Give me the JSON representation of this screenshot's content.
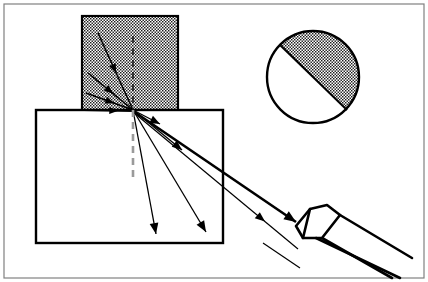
{
  "figure": {
    "width": 428,
    "height": 282,
    "background": "#ffffff"
  },
  "frame": {
    "x": 4,
    "y": 4,
    "width": 420,
    "height": 274,
    "stroke": "#808080",
    "stroke_width": 1.2
  },
  "colors": {
    "ink": "#000000",
    "stipple_dot": "#1a1a1a",
    "stipple_background": "#ffffff",
    "normal_upper": "#1a1a1a",
    "normal_lower": "#9a9a9a",
    "frame": "#808080"
  },
  "upper_medium": {
    "label": "upper-stippled-block",
    "x": 82,
    "y": 16,
    "width": 96,
    "height": 94,
    "stroke": "#000000",
    "stroke_width": 2.2,
    "fill": "stipple"
  },
  "substrate": {
    "label": "lower-substrate-block",
    "x": 36,
    "y": 110,
    "width": 187,
    "height": 133,
    "stroke": "#000000",
    "stroke_width": 2.4,
    "fill": "#ffffff"
  },
  "interface_point": {
    "label": "scattering-point",
    "x": 133,
    "y": 110
  },
  "normal_line": {
    "label": "surface-normal-dashed",
    "x": 133,
    "upper_y1": 36,
    "upper_y2": 110,
    "lower_y1": 110,
    "lower_y2": 180,
    "dash": "7,5",
    "stroke_width_upper": 1.6,
    "stroke_width_lower": 2.6
  },
  "incident_rays": [
    {
      "name": "incident-ray-1",
      "x1": 98,
      "y1": 33,
      "x2": 133,
      "y2": 110,
      "stroke_width": 1.5,
      "arrow_at": 0.52,
      "arrow_size": 9
    },
    {
      "name": "incident-ray-2",
      "x1": 88,
      "y1": 73,
      "x2": 133,
      "y2": 110,
      "stroke_width": 1.6,
      "arrow_at": 0.56,
      "arrow_size": 9
    },
    {
      "name": "incident-ray-3",
      "x1": 86,
      "y1": 93,
      "x2": 133,
      "y2": 110,
      "stroke_width": 1.6,
      "arrow_at": 0.6,
      "arrow_size": 9
    },
    {
      "name": "incident-ray-4",
      "x1": 84,
      "y1": 110,
      "x2": 133,
      "y2": 111,
      "stroke_width": 1.8,
      "arrow_at": 0.7,
      "arrow_size": 9
    }
  ],
  "scattered_rays": [
    {
      "name": "scattered-ray-steep",
      "x1": 133,
      "y1": 110,
      "x2": 156,
      "y2": 234,
      "stroke_width": 1.3,
      "arrow_at": 1.0,
      "arrow_size": 11
    },
    {
      "name": "scattered-ray-mid",
      "x1": 133,
      "y1": 110,
      "x2": 206,
      "y2": 232,
      "stroke_width": 1.3,
      "arrow_at": 1.0,
      "arrow_size": 11
    },
    {
      "name": "scattered-ray-shallow",
      "x1": 133,
      "y1": 110,
      "x2": 182,
      "y2": 150,
      "stroke_width": 1.3,
      "arrow_at": 1.0,
      "arrow_size": 10
    },
    {
      "name": "scattered-ray-grazing",
      "x1": 133,
      "y1": 110,
      "x2": 160,
      "y2": 124,
      "stroke_width": 1.3,
      "arrow_at": 1.0,
      "arrow_size": 10
    }
  ],
  "exit_rays": [
    {
      "name": "exit-ray-thick-to-detector",
      "x1": 133,
      "y1": 111,
      "x2": 296,
      "y2": 222,
      "stroke_width": 2.6,
      "arrow_at": 1.0,
      "arrow_size": 12
    },
    {
      "name": "exit-ray-thin-below-detector",
      "x1": 133,
      "y1": 112,
      "x2": 298,
      "y2": 249,
      "stroke_width": 1.2,
      "arrow_at": 0.8,
      "arrow_size": 10
    }
  ],
  "corner_ray": {
    "name": "detector-body-lower-edge",
    "x1": 316,
    "y1": 238,
    "x2": 400,
    "y2": 278,
    "stroke_width": 2.6
  },
  "detector": {
    "label": "angled-detector-tip",
    "stroke": "#000000",
    "stroke_width": 2.6,
    "outline": [
      [
        296,
        226
      ],
      [
        310,
        209
      ],
      [
        327,
        205
      ],
      [
        340,
        215
      ],
      [
        322,
        238
      ],
      [
        303,
        238
      ]
    ],
    "bevel_edge": [
      [
        310,
        209
      ],
      [
        303,
        238
      ]
    ],
    "tail_top": [
      [
        340,
        215
      ],
      [
        412,
        258
      ]
    ],
    "tail_bottom": [
      [
        322,
        238
      ],
      [
        392,
        278
      ]
    ],
    "thin_tail": [
      [
        263,
        243
      ],
      [
        300,
        268
      ]
    ]
  },
  "inset_circle": {
    "label": "magnified-inset",
    "cx": 313,
    "cy": 77,
    "r": 46,
    "stroke": "#000000",
    "stroke_width": 2.4,
    "chord": {
      "name": "inset-interface-chord",
      "x1": 280,
      "y1": 45,
      "x2": 347,
      "y2": 110,
      "stroke_width": 2.0
    },
    "shaded_half": "upper-right",
    "fill": "stipple"
  },
  "legend": {
    "incident_count": 4,
    "scattered_count": 4,
    "exit_count": 2
  }
}
